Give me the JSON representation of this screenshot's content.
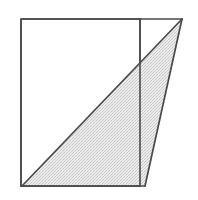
{
  "figure": {
    "name": "rectangle-with-shaded-triangle",
    "canvas": {
      "width": 198,
      "height": 200,
      "background": "#ffffff"
    },
    "colors": {
      "stroke": "#4a4a4a",
      "shade_fill": "#e6e6e6",
      "shade_stipple": "#c9c9c9",
      "rect_fill": "#ffffff"
    },
    "stroke_width": 1.6,
    "shapes": {
      "rectangle": {
        "label": "rectangle",
        "points": "21,19 140,19 140,186 21,186",
        "corners": {
          "top_left": [
            21,
            19
          ],
          "top_right": [
            140,
            19
          ],
          "bottom_right": [
            140,
            186
          ],
          "bottom_left": [
            21,
            186
          ]
        }
      },
      "shaded_triangle": {
        "label": "shaded-triangle",
        "points": "22,186 182,19 145,186",
        "vertices": {
          "bottom_left": [
            22,
            186
          ],
          "apex_top_right": [
            182,
            19
          ],
          "bottom_right": [
            145,
            186
          ]
        }
      },
      "top_edge_extension": {
        "label": "top-edge-extension",
        "from": [
          140,
          19
        ],
        "to": [
          182,
          19
        ]
      },
      "diagonal": {
        "label": "diagonal-bottom-left-to-apex",
        "from": [
          22,
          186
        ],
        "to": [
          182,
          19
        ]
      },
      "right_slant": {
        "label": "right-slant-apex-to-bottom",
        "from": [
          182,
          19
        ],
        "to": [
          145,
          186
        ]
      }
    }
  }
}
